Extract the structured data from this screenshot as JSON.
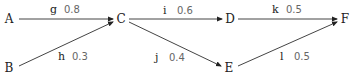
{
  "diagram": {
    "type": "directed-weighted-graph",
    "nodes": [
      {
        "id": "A",
        "label": "A",
        "x": 9,
        "y": 19
      },
      {
        "id": "B",
        "label": "B",
        "x": 9,
        "y": 68
      },
      {
        "id": "C",
        "label": "C",
        "x": 121,
        "y": 19
      },
      {
        "id": "D",
        "label": "D",
        "x": 230,
        "y": 19
      },
      {
        "id": "E",
        "label": "E",
        "x": 229,
        "y": 68
      },
      {
        "id": "F",
        "label": "F",
        "x": 345,
        "y": 19
      }
    ],
    "edges": [
      {
        "id": "g",
        "name": "g",
        "weight": "0.8",
        "from": "A",
        "to": "C",
        "x1": 19,
        "y1": 19,
        "x2": 113,
        "y2": 19,
        "lx": 50,
        "ly": 13
      },
      {
        "id": "h",
        "name": "h",
        "weight": "0.3",
        "from": "B",
        "to": "C",
        "x1": 19,
        "y1": 66,
        "x2": 113,
        "y2": 22,
        "lx": 58,
        "ly": 60
      },
      {
        "id": "i",
        "name": "i",
        "weight": "0.6",
        "from": "C",
        "to": "D",
        "x1": 129,
        "y1": 19,
        "x2": 222,
        "y2": 19,
        "lx": 163,
        "ly": 14
      },
      {
        "id": "j",
        "name": "j",
        "weight": "0.4",
        "from": "C",
        "to": "E",
        "x1": 129,
        "y1": 22,
        "x2": 221,
        "y2": 66,
        "lx": 155,
        "ly": 61
      },
      {
        "id": "k",
        "name": "k",
        "weight": "0.5",
        "from": "D",
        "to": "F",
        "x1": 238,
        "y1": 19,
        "x2": 337,
        "y2": 19,
        "lx": 272,
        "ly": 13
      },
      {
        "id": "l",
        "name": "l",
        "weight": "0.5",
        "from": "E",
        "to": "F",
        "x1": 238,
        "y1": 66,
        "x2": 337,
        "y2": 22,
        "lx": 280,
        "ly": 60
      }
    ]
  }
}
